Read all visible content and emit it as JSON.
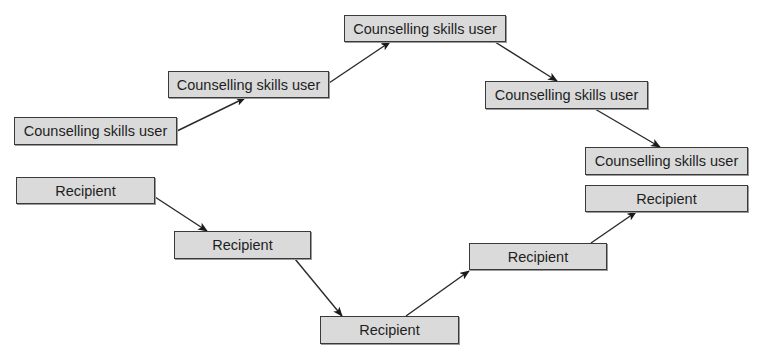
{
  "diagram": {
    "type": "flow",
    "counsellor_nodes": [
      {
        "id": "csu1",
        "label": "Counselling skills user",
        "x": 14,
        "y": 117,
        "w": 163,
        "h": 28
      },
      {
        "id": "csu2",
        "label": "Counselling skills user",
        "x": 168,
        "y": 71,
        "w": 161,
        "h": 27
      },
      {
        "id": "csu3",
        "label": "Counselling skills user",
        "x": 344,
        "y": 15,
        "w": 162,
        "h": 27
      },
      {
        "id": "csu4",
        "label": "Counselling skills user",
        "x": 485,
        "y": 81,
        "w": 163,
        "h": 28
      },
      {
        "id": "csu5",
        "label": "Counselling skills user",
        "x": 585,
        "y": 147,
        "w": 163,
        "h": 28
      }
    ],
    "recipient_nodes": [
      {
        "id": "r1",
        "label": "Recipient",
        "x": 16,
        "y": 177,
        "w": 139,
        "h": 27
      },
      {
        "id": "r2",
        "label": "Recipient",
        "x": 174,
        "y": 231,
        "w": 137,
        "h": 28
      },
      {
        "id": "r3",
        "label": "Recipient",
        "x": 320,
        "y": 316,
        "w": 139,
        "h": 28
      },
      {
        "id": "r4",
        "label": "Recipient",
        "x": 469,
        "y": 243,
        "w": 138,
        "h": 27
      },
      {
        "id": "r5",
        "label": "Recipient",
        "x": 585,
        "y": 185,
        "w": 163,
        "h": 27
      }
    ],
    "edges": [
      {
        "from": "csu1",
        "to": "csu2",
        "x1": 177,
        "y1": 131,
        "x2": 245,
        "y2": 98
      },
      {
        "from": "csu2",
        "to": "csu3",
        "x1": 329,
        "y1": 83,
        "x2": 390,
        "y2": 42
      },
      {
        "from": "csu3",
        "to": "csu4",
        "x1": 495,
        "y1": 42,
        "x2": 557,
        "y2": 81
      },
      {
        "from": "csu4",
        "to": "csu5",
        "x1": 595,
        "y1": 109,
        "x2": 660,
        "y2": 147
      },
      {
        "from": "r1",
        "to": "r2",
        "x1": 155,
        "y1": 197,
        "x2": 207,
        "y2": 231
      },
      {
        "from": "r2",
        "to": "r3",
        "x1": 295,
        "y1": 259,
        "x2": 342,
        "y2": 316
      },
      {
        "from": "r3",
        "to": "r4",
        "x1": 406,
        "y1": 316,
        "x2": 469,
        "y2": 271
      },
      {
        "from": "r4",
        "to": "r5",
        "x1": 591,
        "y1": 243,
        "x2": 636,
        "y2": 212
      }
    ],
    "colors": {
      "node_fill": "#dadada",
      "node_border": "#3a3a3a",
      "edge": "#2a2a2a",
      "text": "#1e1e1e"
    }
  }
}
